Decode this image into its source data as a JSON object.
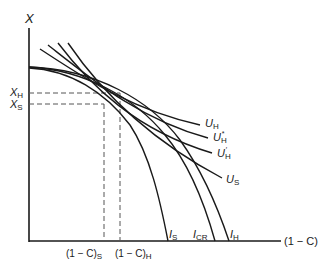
{
  "diagram": {
    "type": "economics-ppf-indifference",
    "axes": {
      "y_label": "X",
      "x_label": "(1 − C)"
    },
    "y_ticks": [
      {
        "main": "X",
        "sub": "H"
      },
      {
        "main": "X",
        "sub": "S"
      }
    ],
    "x_ticks": [
      {
        "main": "(1 − C)",
        "sub": "S"
      },
      {
        "main": "(1 − C)",
        "sub": "H"
      }
    ],
    "frontier_labels": [
      {
        "main": "I",
        "sub": "S"
      },
      {
        "main": "I",
        "sub": "CR"
      },
      {
        "main": "I",
        "sub": "H"
      }
    ],
    "utility_labels": [
      {
        "main": "U",
        "sub": "H",
        "sup": ""
      },
      {
        "main": "U",
        "sub": "H",
        "sup": "*"
      },
      {
        "main": "U",
        "sub": "H",
        "sup": "′"
      },
      {
        "main": "U",
        "sub": "S",
        "sup": ""
      }
    ],
    "colors": {
      "line": "#1a1a1a",
      "dashed": "#555555",
      "background": "#ffffff"
    }
  }
}
